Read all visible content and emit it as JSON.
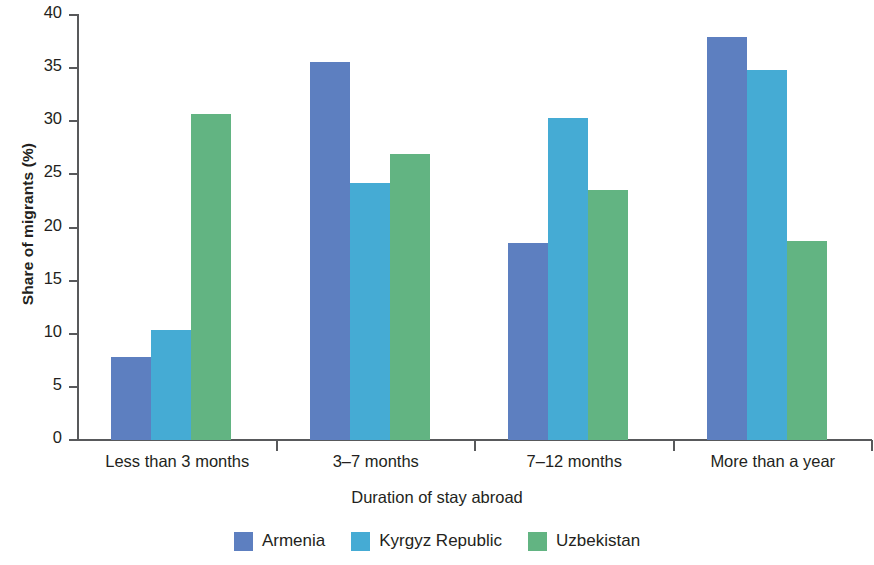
{
  "chart_data": {
    "type": "bar",
    "title": "",
    "xlabel": "Duration of stay abroad",
    "ylabel": "Share of migrants (%)",
    "categories": [
      "Less than 3 months",
      "3–7 months",
      "7–12 months",
      "More than a year"
    ],
    "series": [
      {
        "name": "Armenia",
        "color": "#5d7fc0",
        "values": [
          7.8,
          35.6,
          18.5,
          37.9
        ]
      },
      {
        "name": "Kyrgyz Republic",
        "color": "#45abd4",
        "values": [
          10.4,
          24.2,
          30.3,
          34.8
        ]
      },
      {
        "name": "Uzbekistan",
        "color": "#62b482",
        "values": [
          30.7,
          26.9,
          23.5,
          18.7
        ]
      }
    ],
    "ylim": [
      0,
      40
    ],
    "yticks": [
      "0",
      "5",
      "10",
      "15",
      "20",
      "25",
      "30",
      "35",
      "40"
    ],
    "ytick_values": [
      0,
      5,
      10,
      15,
      20,
      25,
      30,
      35,
      40
    ],
    "grid": false,
    "legend_position": "bottom"
  }
}
